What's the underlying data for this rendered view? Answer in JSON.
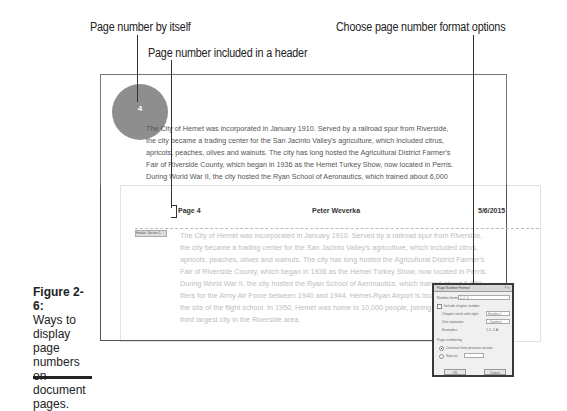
{
  "callouts": {
    "page_number_by_itself": "Page number by itself",
    "page_number_in_header": "Page number included in a header",
    "format_options": "Choose page number format options"
  },
  "page1": {
    "page_number_circle": "4",
    "body_lines": [
      "The City of Hemet was incorporated in January 1910. Served by a railroad spur from Riverside,",
      "the city became a trading center for the San Jacinto Valley's agriculture, which included citrus,",
      "apricots, peaches, olives and walnuts. The city has long hosted the Agricultural District Farmer's",
      "Fair of Riverside County, which began in 1936 as the Hemet Turkey Show, now located in Perris.",
      "During World War II, the city hosted the Ryan School of Aeronautics, which trained about 6,000"
    ]
  },
  "page2": {
    "header": {
      "left": "Page 4",
      "center": "Peter Weverka",
      "right": "5/6/2015",
      "section_tab": "Header -Section 1-"
    },
    "body_lines": [
      "The City of Hemet was incorporated in January 1910. Served by a railroad spur from Riverside,",
      "the city became a trading center for the San Jacinto Valley's agriculture, which included citrus,",
      "apricots, peaches, olives and walnuts. The city has long hosted the Agricultural District Farmer's",
      "Fair of Riverside County, which began in 1936 as the Hemet Turkey Show, now located in Perris.",
      "During World War II, the city hosted the Ryan School of Aeronautics, which trained about 6,000",
      "fliers for the Army Air Force between 1940 and 1944. Hemet-Ryan Airport is located on",
      "the site of the flight school. In 1950, Hemet was home to 10,000 people, joining the",
      "third largest city in the Riverside area."
    ]
  },
  "dialog": {
    "title": "Page Number Format",
    "title_buttons": "? ✕",
    "number_format_label": "Number format:",
    "number_format_value": "1, 2, 3, ...",
    "include_chapter_label": "Include chapter number",
    "chapter_style_label": "Chapter starts with style:",
    "chapter_style_value": "Heading 1",
    "separator_label": "Use separator:",
    "separator_value": "- (hyphen)",
    "examples_label": "Examples:",
    "examples_value": "1-1, 1-A",
    "page_numbering_label": "Page numbering",
    "continue_label": "Continue from previous section",
    "start_at_label": "Start at:",
    "start_at_value": "",
    "ok_label": "OK",
    "cancel_label": "Cancel"
  },
  "caption": {
    "figure": "Figure 2-6:",
    "text": "Ways to display page numbers on document pages."
  }
}
